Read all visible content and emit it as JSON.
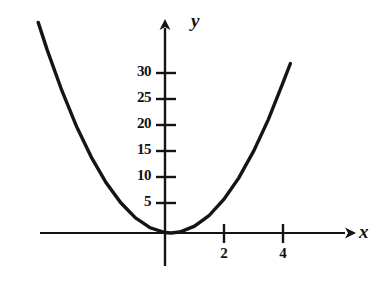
{
  "figure": {
    "background": "#ffffff",
    "ink_color": "#141414",
    "curve_color": "#141414"
  },
  "axes": {
    "x_axis_label": "x",
    "y_axis_label": "y",
    "x_ticks": [
      {
        "value": 2,
        "label": "2"
      },
      {
        "value": 4,
        "label": "4"
      }
    ],
    "y_ticks": [
      {
        "value": 5,
        "label": "5"
      },
      {
        "value": 10,
        "label": "10"
      },
      {
        "value": 15,
        "label": "15"
      },
      {
        "value": 20,
        "label": "20"
      },
      {
        "value": 25,
        "label": "25"
      },
      {
        "value": 30,
        "label": "30"
      }
    ]
  },
  "chart_data": {
    "type": "line",
    "title": "",
    "xlabel": "x",
    "ylabel": "y",
    "xlim": [
      -4.3,
      4.3
    ],
    "ylim": [
      0,
      37
    ],
    "grid": false,
    "legend": null,
    "series": [
      {
        "name": "parabola",
        "equation": "y = 2(x - 0.2)^2",
        "x": [
          -4.3,
          -4.0,
          -3.5,
          -3.0,
          -2.5,
          -2.0,
          -1.5,
          -1.0,
          -0.5,
          0.0,
          0.2,
          0.5,
          1.0,
          1.5,
          2.0,
          2.5,
          3.0,
          3.5,
          4.0,
          4.25
        ],
        "y": [
          40.5,
          35.3,
          27.4,
          20.5,
          14.6,
          9.7,
          5.8,
          2.9,
          1.0,
          0.1,
          0.0,
          0.2,
          1.3,
          3.4,
          6.5,
          10.6,
          15.7,
          21.8,
          28.9,
          32.6
        ]
      }
    ],
    "x_tick_values": [
      2,
      4
    ],
    "y_tick_values": [
      5,
      10,
      15,
      20,
      25,
      30
    ],
    "x_tick_labels": [
      "2",
      "4"
    ],
    "y_tick_labels": [
      "5",
      "10",
      "15",
      "20",
      "25",
      "30"
    ]
  }
}
